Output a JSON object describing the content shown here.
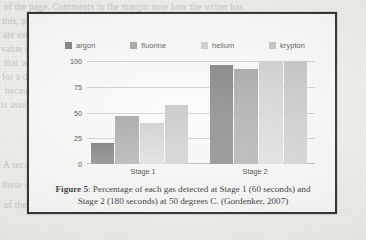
{
  "figure": {
    "caption_label": "Figure 5",
    "caption_rest": ": Percentage of each gas detected at Stage 1 (60 seconds) and Stage 2 (180 seconds) at 50 degrees C. (Gordenker, 2007)"
  },
  "chart_data": {
    "type": "bar",
    "title": "",
    "xlabel": "",
    "ylabel": "",
    "categories": [
      "Stage 1",
      "Stage 2"
    ],
    "ylim": [
      0,
      100
    ],
    "yticks": [
      "0",
      "25",
      "50",
      "75",
      "100"
    ],
    "grid": true,
    "legend_position": "top",
    "series": [
      {
        "name": "argon",
        "color": "#6f6f6f",
        "values": [
          20,
          96
        ]
      },
      {
        "name": "fluorine",
        "color": "#9a9a9a",
        "values": [
          47,
          92
        ]
      },
      {
        "name": "helium",
        "color": "#c9c9c9",
        "values": [
          40,
          100
        ]
      },
      {
        "name": "krypton",
        "color": "#bcbcbc",
        "values": [
          57,
          100
        ]
      }
    ]
  },
  "background_text": [
    "of the page. Comments in the margin note how the writer has",
    "this, pointing along the protruding and bending, and rotating",
    "are established for three reasons, which a nucleus in view of the starting",
    "value can be placed on a mechanical comparison to emulate",
    "that we approximate a state of the difference when a positive",
    "for a different exposure than the last, it is impossible to hold and",
    "because the greater the overall decrement",
    "is assessed by a second set of rotating subordinate comparisons",
    "A second is obtained as the third value of the source of the",
    "these devices to the crease with the aid of the page is a question",
    "of the matter in the earlier section, which may still the matter"
  ]
}
